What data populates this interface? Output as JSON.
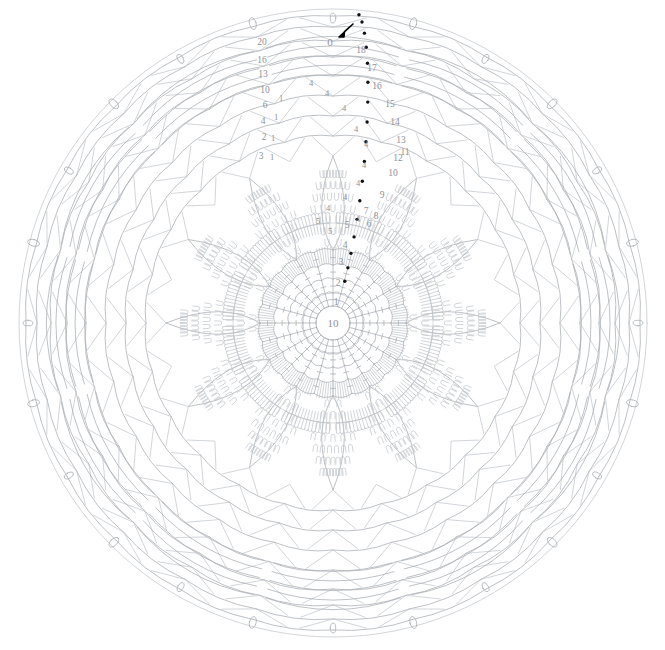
{
  "document": {
    "title": "Crochet Doily Chart",
    "kind": "crochet-stitch-diagram",
    "background_color": "#ffffff"
  },
  "colors": {
    "stitch_line": "#a8acb2",
    "stitch_line_light": "#bfc3c8",
    "label_text": "#8d9298",
    "round_marker": "#101010",
    "start_arrow": "#000000"
  },
  "canvas": {
    "width": 665,
    "height": 650,
    "center_x": 333,
    "center_y": 323
  },
  "center": {
    "ring_label": "10",
    "ring_radius": 17
  },
  "start_marker": {
    "label": "0",
    "icon": "start-arrow-icon",
    "x": 340,
    "y": 34
  },
  "round_labels_right": [
    {
      "text": "18",
      "x": 361,
      "y": 53
    },
    {
      "text": "17",
      "x": 372,
      "y": 71
    },
    {
      "text": "16",
      "x": 377,
      "y": 89
    },
    {
      "text": "15",
      "x": 390,
      "y": 107
    },
    {
      "text": "14",
      "x": 395,
      "y": 125
    },
    {
      "text": "13",
      "x": 401,
      "y": 143
    },
    {
      "text": "12",
      "x": 398,
      "y": 161
    },
    {
      "text": "11",
      "x": 405,
      "y": 155
    },
    {
      "text": "10",
      "x": 393,
      "y": 176
    },
    {
      "text": "9",
      "x": 382,
      "y": 198
    },
    {
      "text": "8",
      "x": 376,
      "y": 219
    },
    {
      "text": "7",
      "x": 366,
      "y": 214
    },
    {
      "text": "6",
      "x": 369,
      "y": 227
    },
    {
      "text": "5",
      "x": 347,
      "y": 228
    },
    {
      "text": "4",
      "x": 345,
      "y": 248
    },
    {
      "text": "3",
      "x": 341,
      "y": 265
    },
    {
      "text": "2",
      "x": 338,
      "y": 286
    },
    {
      "text": "1",
      "x": 336,
      "y": 305
    }
  ],
  "round_labels_left": [
    {
      "text": "20",
      "x": 262,
      "y": 45
    },
    {
      "text": "16",
      "x": 262,
      "y": 63
    },
    {
      "text": "13",
      "x": 263,
      "y": 77
    },
    {
      "text": "10",
      "x": 265,
      "y": 93
    },
    {
      "text": "6",
      "x": 265,
      "y": 108
    },
    {
      "text": "4",
      "x": 263,
      "y": 124
    },
    {
      "text": "2",
      "x": 264,
      "y": 140
    },
    {
      "text": "3",
      "x": 261,
      "y": 159
    }
  ],
  "stitch_count_labels": [
    {
      "text": "4",
      "x": 311,
      "y": 86
    },
    {
      "text": "4",
      "x": 327,
      "y": 96
    },
    {
      "text": "4",
      "x": 344,
      "y": 111
    },
    {
      "text": "4",
      "x": 356,
      "y": 132
    },
    {
      "text": "4",
      "x": 366,
      "y": 147
    },
    {
      "text": "4",
      "x": 364,
      "y": 168
    },
    {
      "text": "4",
      "x": 358,
      "y": 186
    },
    {
      "text": "4",
      "x": 345,
      "y": 200
    },
    {
      "text": "4",
      "x": 328,
      "y": 211
    },
    {
      "text": "4",
      "x": 358,
      "y": 222
    },
    {
      "text": "5",
      "x": 318,
      "y": 224
    },
    {
      "text": "5",
      "x": 330,
      "y": 234
    },
    {
      "text": "1",
      "x": 281,
      "y": 101
    },
    {
      "text": "1",
      "x": 276,
      "y": 120
    },
    {
      "text": "1",
      "x": 273,
      "y": 141
    },
    {
      "text": "1",
      "x": 272,
      "y": 160
    }
  ],
  "structure": {
    "rounds": 18,
    "symmetry_petals": 12,
    "description": "Concentric crochet rounds of chain arcs, double-crochet fans and picot loops radiating from a center ring"
  },
  "legend_note": {
    "visible": false
  }
}
